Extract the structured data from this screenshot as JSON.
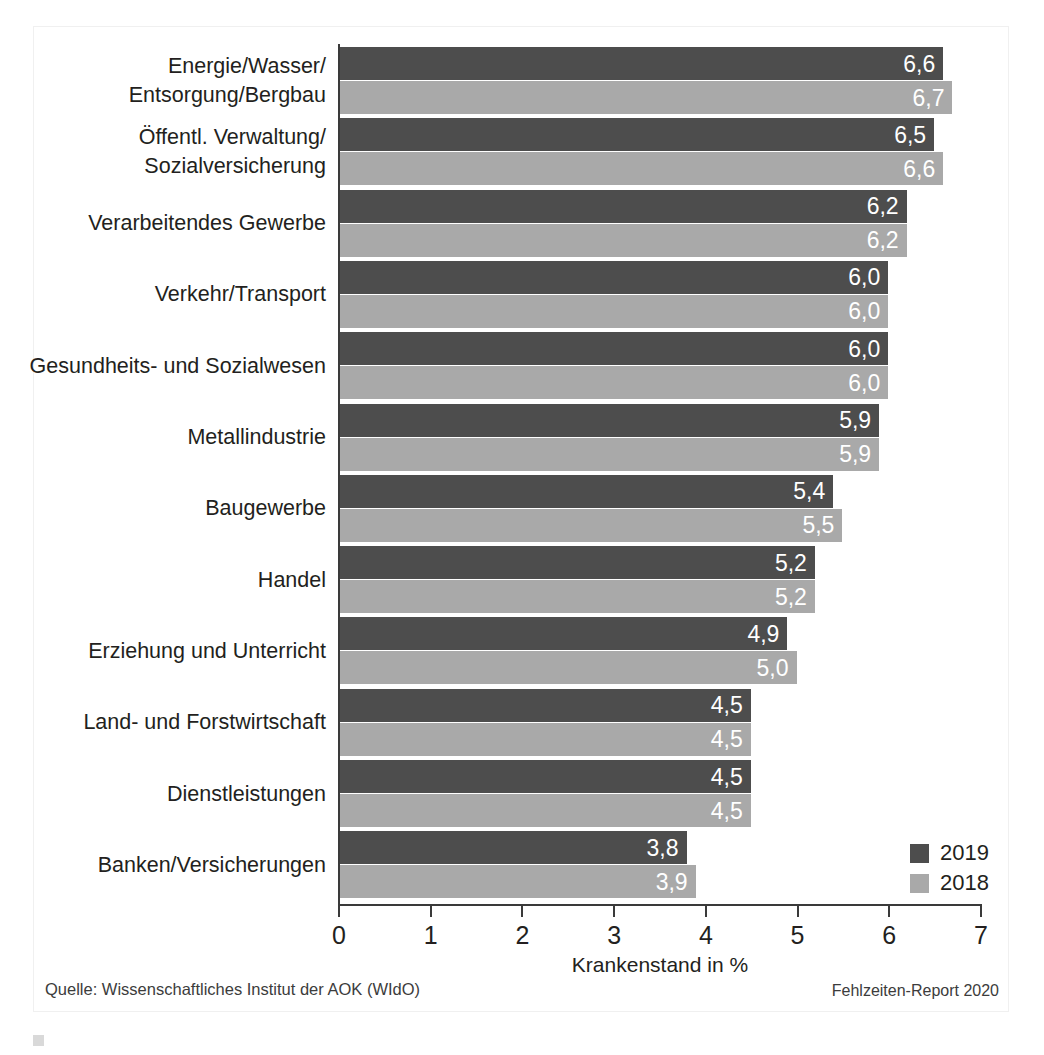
{
  "chart_data": {
    "type": "bar",
    "orientation": "horizontal",
    "title": "",
    "xlabel": "Krankenstand in %",
    "ylabel": "",
    "xlim": [
      0,
      7
    ],
    "xticks": [
      "0",
      "1",
      "2",
      "3",
      "4",
      "5",
      "6",
      "7"
    ],
    "grid": false,
    "legend_position": "bottom-right",
    "categories": [
      "Energie/Wasser/\nEntsorgung/Bergbau",
      "Öffentl. Verwaltung/\nSozialversicherung",
      "Verarbeitendes Gewerbe",
      "Verkehr/Transport",
      "Gesundheits- und Sozialwesen",
      "Metallindustrie",
      "Baugewerbe",
      "Handel",
      "Erziehung und Unterricht",
      "Land- und Forstwirtschaft",
      "Dienstleistungen",
      "Banken/Versicherungen"
    ],
    "series": [
      {
        "name": "2019",
        "color": "#4d4d4d",
        "values": [
          6.6,
          6.5,
          6.2,
          6.0,
          6.0,
          5.9,
          5.4,
          5.2,
          4.9,
          4.5,
          4.5,
          3.8
        ],
        "labels": [
          "6,6",
          "6,5",
          "6,2",
          "6,0",
          "6,0",
          "5,9",
          "5,4",
          "5,2",
          "4,9",
          "4,5",
          "4,5",
          "3,8"
        ]
      },
      {
        "name": "2018",
        "color": "#a9a9a9",
        "values": [
          6.7,
          6.6,
          6.2,
          6.0,
          6.0,
          5.9,
          5.5,
          5.2,
          5.0,
          4.5,
          4.5,
          3.9
        ],
        "labels": [
          "6,7",
          "6,6",
          "6,2",
          "6,0",
          "6,0",
          "5,9",
          "5,5",
          "5,2",
          "5,0",
          "4,5",
          "4,5",
          "3,9"
        ]
      }
    ]
  },
  "categories_display": [
    [
      "Energie/Wasser/",
      "Entsorgung/Bergbau"
    ],
    [
      "Öffentl. Verwaltung/",
      "Sozialversicherung"
    ],
    [
      "Verarbeitendes Gewerbe"
    ],
    [
      "Verkehr/Transport"
    ],
    [
      "Gesundheits- und Sozialwesen"
    ],
    [
      "Metallindustrie"
    ],
    [
      "Baugewerbe"
    ],
    [
      "Handel"
    ],
    [
      "Erziehung und Unterricht"
    ],
    [
      "Land- und Forstwirtschaft"
    ],
    [
      "Dienstleistungen"
    ],
    [
      "Banken/Versicherungen"
    ]
  ],
  "legend": {
    "items": [
      {
        "label": "2019",
        "color": "#4d4d4d"
      },
      {
        "label": "2018",
        "color": "#a9a9a9"
      }
    ]
  },
  "axis": {
    "x_title": "Krankenstand in %",
    "ticks": [
      "0",
      "1",
      "2",
      "3",
      "4",
      "5",
      "6",
      "7"
    ]
  },
  "footer": {
    "source": "Quelle: Wissenschaftliches Institut der AOK (WIdO)",
    "report": "Fehlzeiten-Report 2020"
  },
  "caption": {
    "text": ""
  }
}
